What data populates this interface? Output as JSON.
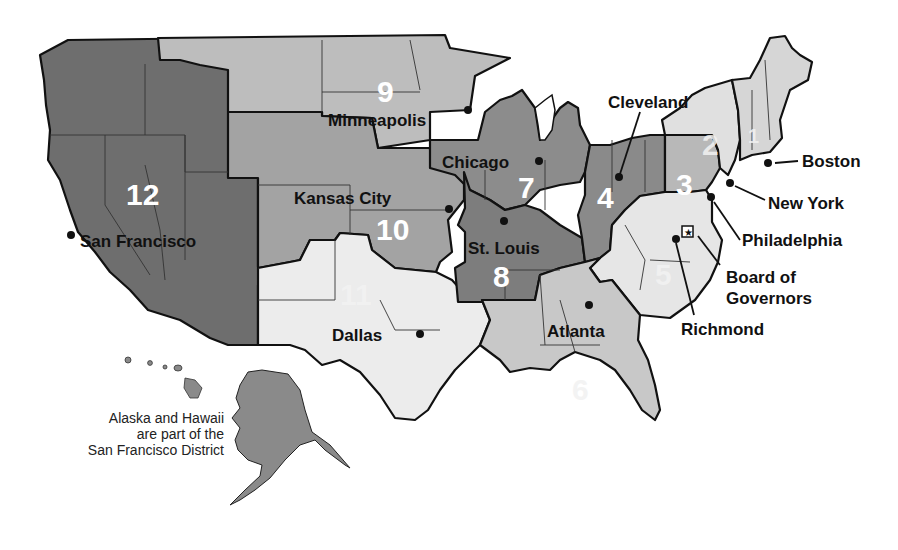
{
  "map": {
    "subject": "Federal Reserve Districts",
    "colors": {
      "district_12": "#6e6e6e",
      "district_9": "#bdbdbd",
      "district_10": "#a3a3a3",
      "district_7": "#8c8c8c",
      "district_8": "#7d7d7d",
      "district_4": "#8a8a8a",
      "district_3": "#b8b8b8",
      "district_2": "#e0e0e0",
      "district_1": "#d6d6d6",
      "district_5": "#e6e6e6",
      "district_6": "#c8c8c8",
      "district_11": "#ececec",
      "alaska_hawaii": "#8a8a8a",
      "outline": "#111111"
    },
    "districts": [
      {
        "number": "1",
        "city": "Boston"
      },
      {
        "number": "2",
        "city": "New York"
      },
      {
        "number": "3",
        "city": "Philadelphia"
      },
      {
        "number": "4",
        "city": "Cleveland"
      },
      {
        "number": "5",
        "city": "Richmond"
      },
      {
        "number": "6",
        "city": "Atlanta"
      },
      {
        "number": "7",
        "city": "Chicago"
      },
      {
        "number": "8",
        "city": "St. Louis"
      },
      {
        "number": "9",
        "city": "Minneapolis"
      },
      {
        "number": "10",
        "city": "Kansas City"
      },
      {
        "number": "11",
        "city": "Dallas"
      },
      {
        "number": "12",
        "city": "San Francisco"
      }
    ],
    "board_label_line1": "Board of",
    "board_label_line2": "Governors",
    "note": {
      "line1": "Alaska and Hawaii",
      "line2": "are part of the",
      "line3": "San Francisco District"
    }
  }
}
